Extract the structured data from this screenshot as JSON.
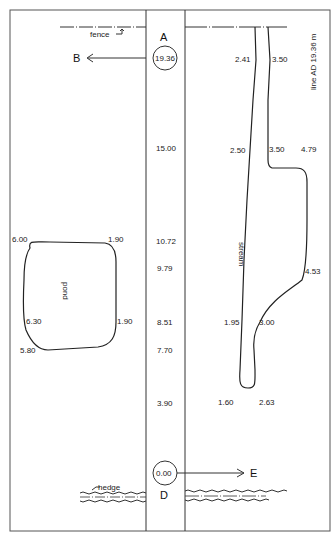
{
  "survey": {
    "chain_line": {
      "start_station": "A",
      "end_station": "D",
      "start_value": "19.36",
      "end_value": "0.00",
      "length_label": "line AD  19.36 m",
      "branch_left": "B",
      "branch_right": "E"
    },
    "chainages": [
      "15.00",
      "10.72",
      "9.79",
      "8.51",
      "7.70",
      "3.90"
    ],
    "features": {
      "fence": "fence",
      "hedge": "hedge",
      "pond": "pond",
      "stream": "stream"
    },
    "pond_offsets": {
      "top_left": "6.00",
      "top_right": "1.90",
      "mid_left": "6.30",
      "mid_right": "1.90",
      "bottom_left": "5.80"
    },
    "stream_offsets": {
      "top_left": "2.41",
      "top_right": "3.50",
      "upper_left": "2.50",
      "upper_mid": "3.50",
      "upper_right": "4.79",
      "mid_right": "4.53",
      "lower_left": "1.95",
      "lower_mid": "3.00",
      "bottom_left": "1.60",
      "bottom_right": "2.63"
    },
    "colors": {
      "ink": "#222222",
      "paper": "#ffffff",
      "frame": "#555555"
    }
  }
}
